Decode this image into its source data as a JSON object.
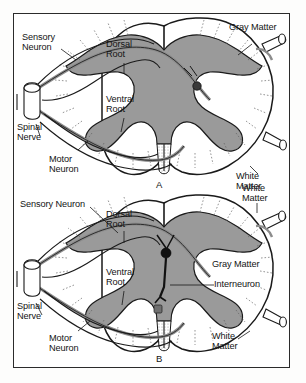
{
  "figure": {
    "border_color": "#2b2b2b",
    "background_color": "#ffffff",
    "gray_matter_color": "#9a9a9a",
    "white_matter_color": "#ffffff",
    "outline_color": "#1a1a1a",
    "neuron_color": "#8c8c8c"
  },
  "panels": [
    {
      "id": "A",
      "letter": "A",
      "labels": {
        "sensory_neuron": "Sensory\nNeuron",
        "gray_matter": "Gray Matter",
        "dorsal_root": "Dorsal\nRoot",
        "ventral_root": "Ventral\nRoot",
        "spinal_nerve": "Spinal\nNerve",
        "motor_neuron": "Motor\nNeuron",
        "white_matter": "White\nMatter"
      }
    },
    {
      "id": "B",
      "letter": "B",
      "labels": {
        "sensory_neuron": "Sensory Neuron",
        "white_matter_top": "White\nMatter",
        "dorsal_root": "Dorsal\nRoot",
        "gray_matter": "Gray Matter",
        "interneuron": "Interneuron",
        "ventral_root": "Ventral\nRoot",
        "spinal_nerve": "Spinal\nNerve",
        "motor_neuron": "Motor\nNeuron",
        "white_matter_bottom": "White\nMatter"
      }
    }
  ]
}
